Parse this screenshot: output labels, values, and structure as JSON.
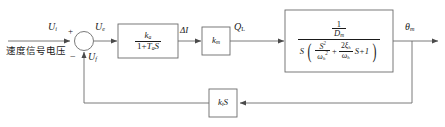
{
  "diagram": {
    "type": "control-system-block-diagram",
    "stroke_color": "#6b6b6b",
    "text_color": "#1a1a1a",
    "background": "#ffffff"
  },
  "input": {
    "signal_label": "U",
    "signal_sub": "i",
    "chinese_caption": "速度信号电压"
  },
  "summing_junction": {
    "name": "summing-junction",
    "plus_sign": "+",
    "minus_sign": "−",
    "feedback_label": "U",
    "feedback_sub": "f",
    "output_label": "U",
    "output_sub": "e"
  },
  "blocks": [
    {
      "name": "amplifier-block",
      "numerator": "k",
      "numerator_sub": "a",
      "den_pre": "1+",
      "den_T": "T",
      "den_T_sub": "a",
      "den_post": "S",
      "output_label": "ΔI"
    },
    {
      "name": "gain-block",
      "label": "k",
      "label_sub": "m",
      "output_label": "Q",
      "output_sub": "L"
    },
    {
      "name": "plant-block",
      "num_one": "1",
      "num_D": "D",
      "num_D_sub": "m",
      "den_S": "S",
      "den_t1_num": "S",
      "den_t1_num_sup": "2",
      "den_t1_den_w": "ω",
      "den_t1_den_sub": "h",
      "den_t1_den_sup": "2",
      "den_plus": "+",
      "den_t2_num_2": "2",
      "den_t2_num_xi": "ξ",
      "den_t2_num_sub": "h",
      "den_t2_den_w": "ω",
      "den_t2_den_sub": "h",
      "den_tail": "S+1",
      "output_label": "θ",
      "output_sub": "m"
    }
  ],
  "feedback": {
    "name": "feedback-block",
    "label_k": "k",
    "label_sub": "t",
    "label_s": "S"
  }
}
